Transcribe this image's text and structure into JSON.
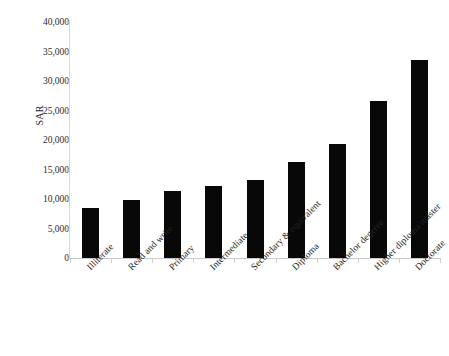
{
  "chart_data": {
    "type": "bar",
    "title": "",
    "xlabel": "",
    "ylabel": "SAR",
    "ylim": [
      0,
      40000
    ],
    "ytick_labels": [
      "40,000",
      "35,000",
      "30,000",
      "25,000",
      "20,000",
      "15,000",
      "10,000",
      "5,000",
      "0"
    ],
    "ytick_values": [
      40000,
      35000,
      30000,
      25000,
      20000,
      15000,
      10000,
      5000,
      0
    ],
    "grid": false,
    "legend": null,
    "bar_color": "#080808",
    "categories": [
      "Illiterate",
      "Read and write",
      "Primary",
      "Intermediate",
      "Secondary & equivalent",
      "Diploma",
      "Bachelor degeree",
      "Higher diploma/master",
      "Doctorate"
    ],
    "values": [
      8400,
      9800,
      11400,
      12200,
      13200,
      16300,
      19400,
      26600,
      33600
    ]
  }
}
